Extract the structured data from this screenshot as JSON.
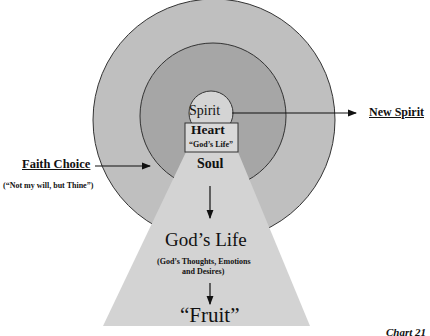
{
  "diagram": {
    "colors": {
      "outer_ring": "#bfbfbf",
      "inner_ring": "#a6a6a6",
      "spirit": "#d4d4d4",
      "heart_box": "#d9d9d9",
      "soul_trapezoid": "#d3d3d3",
      "stroke": "#333333"
    },
    "spirit_label": "Spirit",
    "heart_label": "Heart",
    "heart_sublabel": "“God’s Life”",
    "soul_label": "Soul",
    "gods_life_label": "God’s Life",
    "gods_life_sub_line1": "(God’s Thoughts, Emotions",
    "gods_life_sub_line2": "and Desires)",
    "fruit_label": "“Fruit”",
    "new_spirit_label": "New Spirit",
    "faith_choice_label": "Faith Choice",
    "faith_choice_sub": "(“Not my will, but Thine”)",
    "chart_caption": "Chart 21"
  }
}
